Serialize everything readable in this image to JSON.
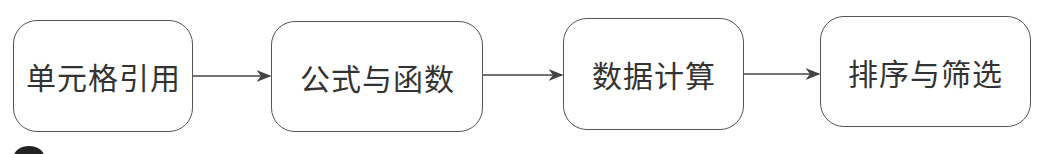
{
  "diagram": {
    "nodes": [
      {
        "id": "n1",
        "label": "单元格引用"
      },
      {
        "id": "n2",
        "label": "公式与函数"
      },
      {
        "id": "n3",
        "label": "数据计算"
      },
      {
        "id": "n4",
        "label": "排序与筛选"
      }
    ],
    "edges": [
      {
        "from": "n1",
        "to": "n2"
      },
      {
        "from": "n2",
        "to": "n3"
      },
      {
        "from": "n3",
        "to": "n4"
      }
    ],
    "colors": {
      "stroke": "#555555",
      "text": "#333333",
      "background": "#ffffff"
    }
  }
}
